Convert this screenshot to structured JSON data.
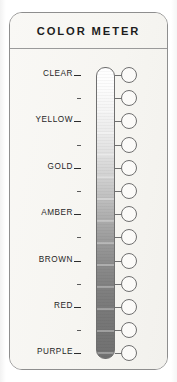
{
  "card": {
    "title": "COLOR METER",
    "background_color": "#f8f7f4",
    "border_color": "#8e8e8e"
  },
  "scale": {
    "name": "color-gradient-scale",
    "orientation": "vertical",
    "top_color": "#ffffff",
    "bottom_color": "#717171",
    "major_labels": [
      "CLEAR",
      "YELLOW",
      "GOLD",
      "AMBER",
      "BROWN",
      "RED",
      "PURPLE"
    ],
    "minor_tick_count": 6,
    "node_count": 13
  },
  "chart_data": {
    "type": "bar",
    "title": "COLOR METER",
    "xlabel": "",
    "ylabel": "",
    "categories": [
      "CLEAR",
      "",
      "YELLOW",
      "",
      "GOLD",
      "",
      "AMBER",
      "",
      "BROWN",
      "",
      "RED",
      "",
      "PURPLE"
    ],
    "values": [
      1,
      2,
      3,
      4,
      5,
      6,
      7,
      8,
      9,
      10,
      11,
      12,
      13
    ],
    "swatch_colors": [
      "#ffffff",
      "#f7f7f7",
      "#ebebeb",
      "#dedede",
      "#cccccc",
      "#b6b6b6",
      "#a2a2a2",
      "#949494",
      "#8a8a8a",
      "#818181",
      "#7b7b7b",
      "#767676",
      "#717171"
    ],
    "legend": [],
    "grid": false
  }
}
